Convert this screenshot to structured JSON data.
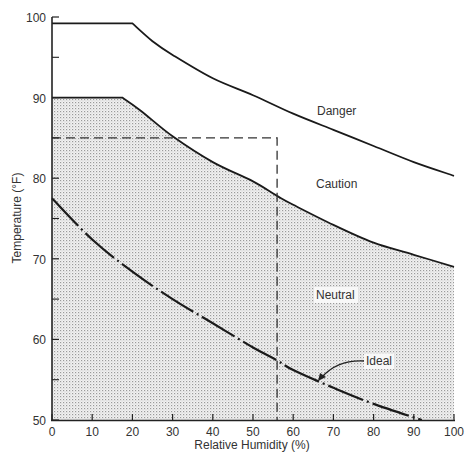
{
  "chart_data": {
    "type": "line",
    "title": "",
    "xlabel": "Relative Humidity (%)",
    "ylabel": "Temperature (°F)",
    "xlim": [
      0,
      100
    ],
    "ylim": [
      50,
      100
    ],
    "grid": false,
    "legend": "none (inline region labels)",
    "x_ticks": [
      0,
      10,
      20,
      30,
      40,
      50,
      60,
      70,
      80,
      90,
      100
    ],
    "y_ticks": [
      50,
      60,
      70,
      80,
      90,
      100
    ],
    "y_minor_ticks": [
      55,
      65,
      75,
      85,
      95
    ],
    "series": [
      {
        "name": "Danger/Caution boundary",
        "style": "solid",
        "points": [
          [
            0,
            99.2
          ],
          [
            20,
            99.2
          ],
          [
            25,
            97.0
          ],
          [
            30,
            95.3
          ],
          [
            40,
            92.4
          ],
          [
            50,
            90.3
          ],
          [
            60,
            88.0
          ],
          [
            70,
            86.0
          ],
          [
            80,
            84.0
          ],
          [
            90,
            82.0
          ],
          [
            100,
            80.3
          ]
        ]
      },
      {
        "name": "Caution/Neutral boundary",
        "style": "solid",
        "fill_below": "stippled",
        "points": [
          [
            0,
            90.0
          ],
          [
            17.5,
            90.0
          ],
          [
            22,
            88.4
          ],
          [
            30,
            85.2
          ],
          [
            40,
            82.0
          ],
          [
            50,
            79.6
          ],
          [
            56,
            77.8
          ],
          [
            60,
            76.7
          ],
          [
            70,
            74.2
          ],
          [
            80,
            72.0
          ],
          [
            90,
            70.5
          ],
          [
            100,
            69.0
          ]
        ]
      },
      {
        "name": "Ideal",
        "style": "dash-dot",
        "points": [
          [
            0,
            77.5
          ],
          [
            10,
            72.4
          ],
          [
            20,
            68.4
          ],
          [
            30,
            65.0
          ],
          [
            40,
            62.0
          ],
          [
            50,
            59.0
          ],
          [
            56,
            57.4
          ],
          [
            60,
            56.2
          ],
          [
            70,
            54.0
          ],
          [
            80,
            52.0
          ],
          [
            92,
            50.0
          ]
        ]
      },
      {
        "name": "Reference (85°F / 56% RH)",
        "style": "dashed",
        "points": [
          [
            0,
            85
          ],
          [
            56,
            85
          ],
          [
            56,
            50
          ]
        ]
      }
    ],
    "annotations": [
      {
        "text": "Danger",
        "x": 70,
        "y": 89
      },
      {
        "text": "Caution",
        "x": 73,
        "y": 80
      },
      {
        "text": "Neutral",
        "x": 68,
        "y": 68
      },
      {
        "text": "Ideal",
        "x": 70,
        "y": 57.5,
        "arrow_to": [
          67,
          54.5
        ]
      }
    ]
  },
  "labels": {
    "x_axis_title": "Relative Humidity (%)",
    "y_axis_title": "Temperature (°F)",
    "danger": "Danger",
    "caution": "Caution",
    "neutral": "Neutral",
    "ideal": "Ideal"
  },
  "x_tick_labels": [
    "0",
    "10",
    "20",
    "30",
    "40",
    "50",
    "60",
    "70",
    "80",
    "90",
    "100"
  ],
  "y_tick_labels": [
    "50",
    "60",
    "70",
    "80",
    "90",
    "100"
  ]
}
